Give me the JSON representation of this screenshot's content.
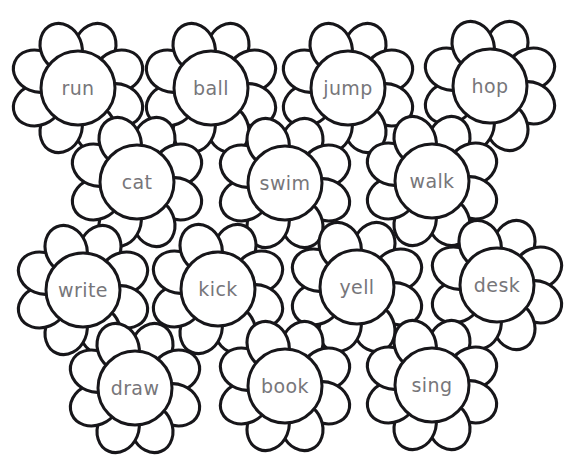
{
  "page": {
    "background_color": "#ffffff",
    "width": 576,
    "height": 470
  },
  "style": {
    "outline_color": "#17161a",
    "petal_fill": "#ffffff",
    "core_fill": "#ffffff",
    "text_color": "#77767a",
    "petal_count": 8
  },
  "flowers": [
    {
      "word": "run",
      "x": 78,
      "y": 88,
      "row": 1,
      "col": 1,
      "icon": "flower-icon"
    },
    {
      "word": "ball",
      "x": 211,
      "y": 88,
      "row": 1,
      "col": 2,
      "icon": "flower-icon"
    },
    {
      "word": "jump",
      "x": 348,
      "y": 88,
      "row": 1,
      "col": 3,
      "icon": "flower-icon"
    },
    {
      "word": "hop",
      "x": 490,
      "y": 86,
      "row": 1,
      "col": 4,
      "icon": "flower-icon"
    },
    {
      "word": "cat",
      "x": 137,
      "y": 182,
      "row": 2,
      "col": 1,
      "icon": "flower-icon"
    },
    {
      "word": "swim",
      "x": 285,
      "y": 183,
      "row": 2,
      "col": 2,
      "icon": "flower-icon"
    },
    {
      "word": "walk",
      "x": 432,
      "y": 181,
      "row": 2,
      "col": 3,
      "icon": "flower-icon"
    },
    {
      "word": "write",
      "x": 83,
      "y": 290,
      "row": 3,
      "col": 1,
      "icon": "flower-icon"
    },
    {
      "word": "kick",
      "x": 218,
      "y": 289,
      "row": 3,
      "col": 2,
      "icon": "flower-icon"
    },
    {
      "word": "yell",
      "x": 357,
      "y": 287,
      "row": 3,
      "col": 3,
      "icon": "flower-icon"
    },
    {
      "word": "desk",
      "x": 497,
      "y": 285,
      "row": 3,
      "col": 4,
      "icon": "flower-icon"
    },
    {
      "word": "draw",
      "x": 135,
      "y": 388,
      "row": 4,
      "col": 1,
      "icon": "flower-icon"
    },
    {
      "word": "book",
      "x": 285,
      "y": 386,
      "row": 4,
      "col": 2,
      "icon": "flower-icon"
    },
    {
      "word": "sing",
      "x": 432,
      "y": 385,
      "row": 4,
      "col": 3,
      "icon": "flower-icon"
    }
  ]
}
